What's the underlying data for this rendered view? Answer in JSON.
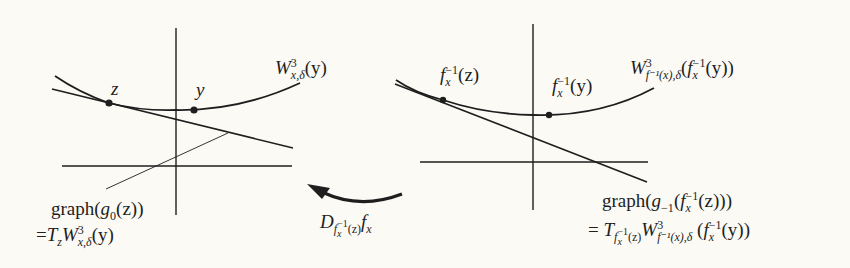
{
  "diagram": {
    "left_panel": {
      "curve_label": {
        "main": "W",
        "sup": "3",
        "sub": "x,δ",
        "arg": "(y)"
      },
      "point_z_label": "z",
      "point_y_label": "y",
      "tangent_label_line1": {
        "prefix": "graph(",
        "fn": "g",
        "fn_sub": "0",
        "arg": "(z))"
      },
      "tangent_label_line2": {
        "prefix": "=",
        "T": "T",
        "T_sub": "z",
        "W": "W",
        "W_sup": "3",
        "W_sub": "x,δ",
        "arg": "(y)"
      }
    },
    "right_panel": {
      "curve_label": {
        "main": "W",
        "sup": "3",
        "sub": "f⁻¹(x),δ",
        "arg_open": "(",
        "f": "f",
        "f_sub": "x",
        "f_sup": "−1",
        "arg_close": "(y))"
      },
      "point_z_label": {
        "f": "f",
        "f_sub": "x",
        "f_sup": "−1",
        "arg": "(z)"
      },
      "point_y_label": {
        "f": "f",
        "f_sub": "x",
        "f_sup": "−1",
        "arg": "(y)"
      },
      "tangent_label_line1": {
        "prefix": "graph(",
        "fn": "g",
        "fn_sub": "−1",
        "open": "(",
        "f": "f",
        "f_sub": "x",
        "f_sup": "−1",
        "arg": "(z)))"
      },
      "tangent_label_line2": {
        "prefix": "= ",
        "T": "T",
        "T_sub": "f",
        "T_sub_sub": "x",
        "T_sub_sup": "−1",
        "T_sub_arg": "(z)",
        "W": "W",
        "W_sup": "3",
        "W_sub": "f⁻¹(x),δ",
        "arg_open": " (",
        "f": "f",
        "f_sub": "x",
        "f_sup": "−1",
        "arg_close": "(y))"
      }
    },
    "arrow_label": {
      "D": "D",
      "sub_f": "f",
      "sub_f_sub": "x",
      "sub_f_sup": "−1",
      "sub_arg": "(z)",
      "f": "f",
      "f_sub": "x"
    },
    "colors": {
      "ink": "#1e1e1e",
      "background": "#fbfaf5"
    }
  }
}
